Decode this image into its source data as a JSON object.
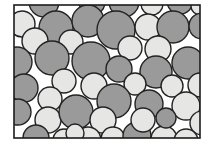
{
  "figure": {
    "name": "packed-circle-microstructure",
    "background_color": "#ffffff",
    "frame": {
      "x": 14,
      "y": 5,
      "width": 186,
      "height": 133,
      "stroke_color": "#1c1c1c",
      "stroke_width": 1.6,
      "fill_color": "#ffffff"
    },
    "phases": [
      {
        "id": "dark",
        "label": "dark-grain",
        "fill": "#9a9a9a",
        "stroke": "#232323",
        "stroke_width": 1.4
      },
      {
        "id": "light",
        "label": "light-grain",
        "fill": "#e6e6e4",
        "stroke": "#232323",
        "stroke_width": 1.4
      }
    ],
    "grains": [
      {
        "cx": 44,
        "cy": 2,
        "r": 15,
        "phase": "dark"
      },
      {
        "cx": 92,
        "cy": 2,
        "r": 13,
        "phase": "dark"
      },
      {
        "cx": 124,
        "cy": 2,
        "r": 15,
        "phase": "dark"
      },
      {
        "cx": 152,
        "cy": 4,
        "r": 11,
        "phase": "light"
      },
      {
        "cx": 180,
        "cy": 1,
        "r": 13,
        "phase": "dark"
      },
      {
        "cx": 200,
        "cy": 6,
        "r": 9,
        "phase": "light"
      },
      {
        "cx": 22,
        "cy": 24,
        "r": 13,
        "phase": "light"
      },
      {
        "cx": 56,
        "cy": 28,
        "r": 17,
        "phase": "dark"
      },
      {
        "cx": 88,
        "cy": 21,
        "r": 16,
        "phase": "dark"
      },
      {
        "cx": 116,
        "cy": 30,
        "r": 19,
        "phase": "dark"
      },
      {
        "cx": 148,
        "cy": 27,
        "r": 13,
        "phase": "light"
      },
      {
        "cx": 173,
        "cy": 27,
        "r": 16,
        "phase": "dark"
      },
      {
        "cx": 202,
        "cy": 26,
        "r": 13,
        "phase": "dark"
      },
      {
        "cx": 35,
        "cy": 41,
        "r": 13,
        "phase": "light"
      },
      {
        "cx": 71,
        "cy": 42,
        "r": 12,
        "phase": "light"
      },
      {
        "cx": 130,
        "cy": 48,
        "r": 12,
        "phase": "light"
      },
      {
        "cx": 158,
        "cy": 49,
        "r": 13,
        "phase": "light"
      },
      {
        "cx": 17,
        "cy": 62,
        "r": 15,
        "phase": "dark"
      },
      {
        "cx": 52,
        "cy": 58,
        "r": 17,
        "phase": "dark"
      },
      {
        "cx": 91,
        "cy": 61,
        "r": 19,
        "phase": "dark"
      },
      {
        "cx": 119,
        "cy": 69,
        "r": 13,
        "phase": "dark"
      },
      {
        "cx": 156,
        "cy": 72,
        "r": 16,
        "phase": "dark"
      },
      {
        "cx": 188,
        "cy": 63,
        "r": 16,
        "phase": "dark"
      },
      {
        "cx": 64,
        "cy": 81,
        "r": 12,
        "phase": "light"
      },
      {
        "cx": 94,
        "cy": 86,
        "r": 13,
        "phase": "light"
      },
      {
        "cx": 135,
        "cy": 84,
        "r": 11,
        "phase": "light"
      },
      {
        "cx": 172,
        "cy": 86,
        "r": 11,
        "phase": "light"
      },
      {
        "cx": 200,
        "cy": 85,
        "r": 12,
        "phase": "light"
      },
      {
        "cx": 24,
        "cy": 88,
        "r": 14,
        "phase": "dark"
      },
      {
        "cx": 50,
        "cy": 99,
        "r": 12,
        "phase": "light"
      },
      {
        "cx": 114,
        "cy": 101,
        "r": 17,
        "phase": "dark"
      },
      {
        "cx": 149,
        "cy": 104,
        "r": 14,
        "phase": "dark"
      },
      {
        "cx": 18,
        "cy": 112,
        "r": 13,
        "phase": "dark"
      },
      {
        "cx": 48,
        "cy": 120,
        "r": 13,
        "phase": "light"
      },
      {
        "cx": 76,
        "cy": 112,
        "r": 17,
        "phase": "dark"
      },
      {
        "cx": 103,
        "cy": 120,
        "r": 13,
        "phase": "light"
      },
      {
        "cx": 186,
        "cy": 106,
        "r": 14,
        "phase": "light"
      },
      {
        "cx": 202,
        "cy": 123,
        "r": 12,
        "phase": "light"
      },
      {
        "cx": 36,
        "cy": 138,
        "r": 13,
        "phase": "dark"
      },
      {
        "cx": 64,
        "cy": 140,
        "r": 11,
        "phase": "light"
      },
      {
        "cx": 88,
        "cy": 140,
        "r": 13,
        "phase": "light"
      },
      {
        "cx": 113,
        "cy": 139,
        "r": 12,
        "phase": "light"
      },
      {
        "cx": 137,
        "cy": 136,
        "r": 14,
        "phase": "dark"
      },
      {
        "cx": 164,
        "cy": 139,
        "r": 13,
        "phase": "light"
      },
      {
        "cx": 186,
        "cy": 141,
        "r": 12,
        "phase": "light"
      },
      {
        "cx": 143,
        "cy": 120,
        "r": 12,
        "phase": "light"
      },
      {
        "cx": 166,
        "cy": 118,
        "r": 10,
        "phase": "dark"
      },
      {
        "cx": 75,
        "cy": 133,
        "r": 9,
        "phase": "light"
      }
    ]
  }
}
